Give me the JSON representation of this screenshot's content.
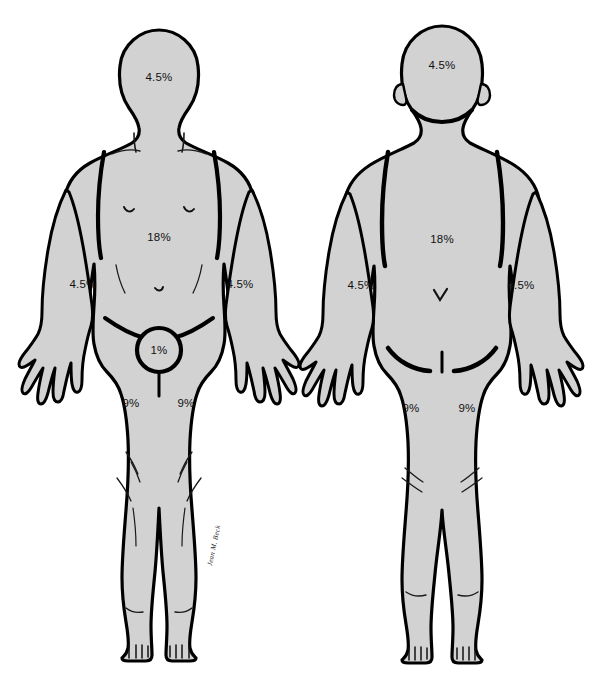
{
  "figure": {
    "background_color": "#ffffff",
    "body_fill_color": "#d2d2d2",
    "outline_color": "#000000",
    "label_color": "#111111"
  },
  "views": [
    {
      "id": "anterior",
      "name": "front-view-figure",
      "labels": [
        {
          "id": "front-head",
          "name": "label-front-head",
          "text": "4.5%",
          "x": 159,
          "y": 78,
          "region": "head front"
        },
        {
          "id": "front-torso",
          "name": "label-front-torso",
          "text": "18%",
          "x": 159,
          "y": 238,
          "region": "anterior trunk"
        },
        {
          "id": "front-arm-right",
          "name": "label-front-right-arm",
          "text": "4.5%",
          "x": 83,
          "y": 285,
          "region": "right arm front"
        },
        {
          "id": "front-arm-left",
          "name": "label-front-left-arm",
          "text": "4.5%",
          "x": 240,
          "y": 285,
          "region": "left arm front"
        },
        {
          "id": "front-genital",
          "name": "label-genital-area",
          "text": "1%",
          "x": 159,
          "y": 350,
          "region": "perineum"
        },
        {
          "id": "front-leg-right",
          "name": "label-front-right-leg",
          "text": "9%",
          "x": 131,
          "y": 404,
          "region": "right leg front"
        },
        {
          "id": "front-leg-left",
          "name": "label-front-left-leg",
          "text": "9%",
          "x": 186,
          "y": 404,
          "region": "left leg front"
        }
      ]
    },
    {
      "id": "posterior",
      "name": "back-view-figure",
      "labels": [
        {
          "id": "back-head",
          "name": "label-back-head",
          "text": "4.5%",
          "x": 442,
          "y": 66,
          "region": "head back"
        },
        {
          "id": "back-torso",
          "name": "label-back-torso",
          "text": "18%",
          "x": 442,
          "y": 240,
          "region": "posterior trunk"
        },
        {
          "id": "back-arm-left",
          "name": "label-back-left-arm",
          "text": "4.5%",
          "x": 361,
          "y": 286,
          "region": "left arm back"
        },
        {
          "id": "back-arm-right",
          "name": "label-back-right-arm",
          "text": "4.5%",
          "x": 521,
          "y": 286,
          "region": "right arm back"
        },
        {
          "id": "back-leg-left",
          "name": "label-back-left-leg",
          "text": "9%",
          "x": 411,
          "y": 409,
          "region": "left leg back"
        },
        {
          "id": "back-leg-right",
          "name": "label-back-right-leg",
          "text": "9%",
          "x": 467,
          "y": 409,
          "region": "right leg back"
        }
      ]
    }
  ],
  "signature": {
    "name": "artist-signature",
    "text": "Jean M. Beck",
    "x": 216,
    "y": 546,
    "rotation": -78
  }
}
